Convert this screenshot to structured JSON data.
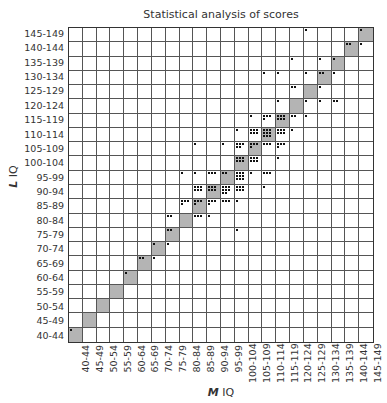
{
  "chart_data": {
    "type": "heatmap",
    "title": "Statistical analysis of scores",
    "xlabel": "M IQ",
    "ylabel": "L IQ",
    "categories_x": [
      "40-44",
      "45-49",
      "50-54",
      "55-59",
      "60-64",
      "65-69",
      "70-74",
      "75-79",
      "80-84",
      "85-89",
      "90-94",
      "95-99",
      "100-104",
      "105-109",
      "110-114",
      "115-119",
      "120-124",
      "125-129",
      "130-134",
      "135-139",
      "140-144",
      "145-149"
    ],
    "categories_y": [
      "40-44",
      "45-49",
      "50-54",
      "55-59",
      "60-64",
      "65-69",
      "70-74",
      "75-79",
      "80-84",
      "85-89",
      "90-94",
      "95-99",
      "100-104",
      "105-109",
      "110-114",
      "115-119",
      "120-124",
      "125-129",
      "130-134",
      "135-139",
      "140-144",
      "145-149"
    ],
    "diagonal_shaded": true,
    "grid": true,
    "cells": [
      {
        "y": "40-44",
        "x": "40-44",
        "count": 1
      },
      {
        "y": "60-64",
        "x": "60-64",
        "count": 1
      },
      {
        "y": "65-69",
        "x": "65-69",
        "count": 2
      },
      {
        "y": "65-69",
        "x": "70-74",
        "count": 1
      },
      {
        "y": "70-74",
        "x": "70-74",
        "count": 1
      },
      {
        "y": "70-74",
        "x": "75-79",
        "count": 1
      },
      {
        "y": "75-79",
        "x": "75-79",
        "count": 2
      },
      {
        "y": "75-79",
        "x": "100-104",
        "count": 1
      },
      {
        "y": "80-84",
        "x": "75-79",
        "count": 2
      },
      {
        "y": "80-84",
        "x": "85-89",
        "count": 3
      },
      {
        "y": "80-84",
        "x": "90-94",
        "count": 1
      },
      {
        "y": "85-89",
        "x": "80-84",
        "count": 4
      },
      {
        "y": "85-89",
        "x": "85-89",
        "count": 4
      },
      {
        "y": "85-89",
        "x": "90-94",
        "count": 4
      },
      {
        "y": "85-89",
        "x": "95-99",
        "count": 3
      },
      {
        "y": "85-89",
        "x": "100-104",
        "count": 1
      },
      {
        "y": "90-94",
        "x": "85-89",
        "count": 6
      },
      {
        "y": "90-94",
        "x": "90-94",
        "count": 6
      },
      {
        "y": "90-94",
        "x": "95-99",
        "count": 8
      },
      {
        "y": "90-94",
        "x": "100-104",
        "count": 6
      },
      {
        "y": "90-94",
        "x": "110-114",
        "count": 1
      },
      {
        "y": "95-99",
        "x": "80-84",
        "count": 1
      },
      {
        "y": "95-99",
        "x": "85-89",
        "count": 1
      },
      {
        "y": "95-99",
        "x": "90-94",
        "count": 3
      },
      {
        "y": "95-99",
        "x": "95-99",
        "count": 2
      },
      {
        "y": "95-99",
        "x": "100-104",
        "count": 9
      },
      {
        "y": "95-99",
        "x": "105-109",
        "count": 1
      },
      {
        "y": "95-99",
        "x": "110-114",
        "count": 3
      },
      {
        "y": "100-104",
        "x": "100-104",
        "count": 6
      },
      {
        "y": "100-104",
        "x": "105-109",
        "count": 6
      },
      {
        "y": "100-104",
        "x": "115-119",
        "count": 1
      },
      {
        "y": "105-109",
        "x": "85-89",
        "count": 1
      },
      {
        "y": "105-109",
        "x": "95-99",
        "count": 1
      },
      {
        "y": "105-109",
        "x": "100-104",
        "count": 5
      },
      {
        "y": "105-109",
        "x": "105-109",
        "count": 4
      },
      {
        "y": "105-109",
        "x": "110-114",
        "count": 3
      },
      {
        "y": "105-109",
        "x": "115-119",
        "count": 4
      },
      {
        "y": "110-114",
        "x": "100-104",
        "count": 1
      },
      {
        "y": "110-114",
        "x": "105-109",
        "count": 6
      },
      {
        "y": "110-114",
        "x": "110-114",
        "count": 9
      },
      {
        "y": "110-114",
        "x": "115-119",
        "count": 6
      },
      {
        "y": "110-114",
        "x": "120-124",
        "count": 1
      },
      {
        "y": "115-119",
        "x": "105-109",
        "count": 1
      },
      {
        "y": "115-119",
        "x": "110-114",
        "count": 4
      },
      {
        "y": "115-119",
        "x": "115-119",
        "count": 6
      },
      {
        "y": "115-119",
        "x": "120-124",
        "count": 2
      },
      {
        "y": "115-119",
        "x": "125-129",
        "count": 1
      },
      {
        "y": "120-124",
        "x": "115-119",
        "count": 1
      },
      {
        "y": "120-124",
        "x": "125-129",
        "count": 1
      },
      {
        "y": "120-124",
        "x": "130-134",
        "count": 1
      },
      {
        "y": "120-124",
        "x": "135-139",
        "count": 2
      },
      {
        "y": "125-129",
        "x": "120-124",
        "count": 2
      },
      {
        "y": "125-129",
        "x": "130-134",
        "count": 1
      },
      {
        "y": "130-134",
        "x": "110-114",
        "count": 1
      },
      {
        "y": "130-134",
        "x": "115-119",
        "count": 1
      },
      {
        "y": "130-134",
        "x": "125-129",
        "count": 1
      },
      {
        "y": "130-134",
        "x": "130-134",
        "count": 2
      },
      {
        "y": "130-134",
        "x": "135-139",
        "count": 1
      },
      {
        "y": "135-139",
        "x": "120-124",
        "count": 1
      },
      {
        "y": "135-139",
        "x": "130-134",
        "count": 1
      },
      {
        "y": "135-139",
        "x": "135-139",
        "count": 1
      },
      {
        "y": "140-144",
        "x": "140-144",
        "count": 2
      },
      {
        "y": "140-144",
        "x": "145-149",
        "count": 1
      },
      {
        "y": "145-149",
        "x": "125-129",
        "count": 1
      },
      {
        "y": "145-149",
        "x": "145-149",
        "count": 1
      }
    ]
  },
  "labels": {
    "title": "Statistical analysis of scores",
    "x_axis_prefix": "M",
    "x_axis_suffix": " IQ",
    "y_axis_prefix": "L",
    "y_axis_suffix": " IQ"
  },
  "colors": {
    "diagonal_fill": "#b4b4b4",
    "grid_line": "#555555",
    "dot": "#111111"
  }
}
